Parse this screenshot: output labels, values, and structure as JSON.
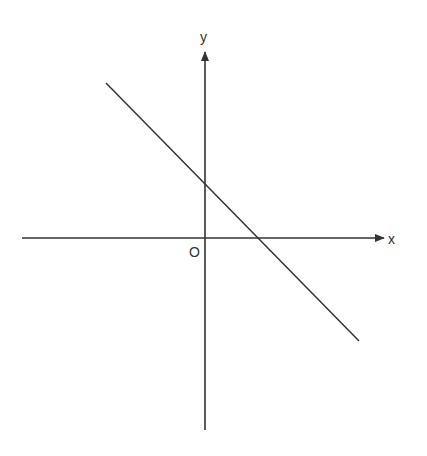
{
  "diagram": {
    "type": "coordinate-plane-line",
    "axes": {
      "x_label": "x",
      "y_label": "y",
      "origin_label": "O"
    },
    "line": {
      "description": "straight line with negative slope, positive y-intercept and positive x-intercept",
      "slope_sign": "negative"
    },
    "colors": {
      "stroke": "#333333",
      "background": "#ffffff"
    }
  }
}
